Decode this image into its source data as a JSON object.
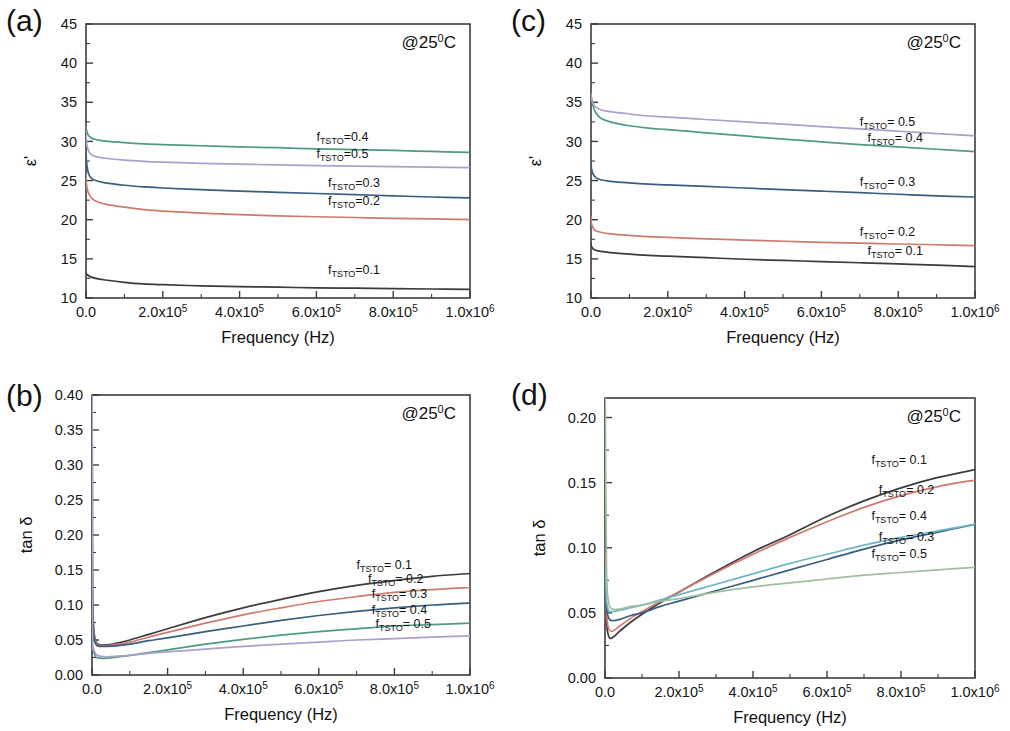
{
  "figure": {
    "panels": [
      "a",
      "b",
      "c",
      "d"
    ],
    "temperature_annotation": {
      "prefix": "@25",
      "sup": "0",
      "suffix": "C"
    },
    "series_colors": {
      "0.1": "#3b3b3b",
      "0.2": "#cf7a6d",
      "0.3": "#3a5d82",
      "0.4": "#4e9b80",
      "0.5": "#a9a0cb"
    }
  },
  "panel_a": {
    "tag": "(a)",
    "xlabel": "Frequency (Hz)",
    "ylabel": "ε'",
    "temp": "@25",
    "temp_sup": "0",
    "temp_suffix": "C",
    "ylim": [
      10,
      45
    ],
    "yticks": [
      10,
      15,
      20,
      25,
      30,
      35,
      40,
      45
    ],
    "xticks": [
      "0.0",
      "2.0x10",
      "4.0x10",
      "6.0x10",
      "8.0x10",
      "1.0x10"
    ],
    "xtick_sups": [
      "",
      "5",
      "5",
      "5",
      "5",
      "6"
    ],
    "labels": [
      {
        "text": "f",
        "sub": "TSTO",
        "rest": "=0.4"
      },
      {
        "text": "f",
        "sub": "TSTO",
        "rest": "=0.5"
      },
      {
        "text": "f",
        "sub": "TSTO",
        "rest": "=0.3"
      },
      {
        "text": "f",
        "sub": "TSTO",
        "rest": "=0.2"
      },
      {
        "text": "f",
        "sub": "TSTO",
        "rest": "=0.1"
      }
    ]
  },
  "panel_b": {
    "tag": "(b)",
    "xlabel": "Frequency (Hz)",
    "ylabel": "tan δ",
    "temp": "@25",
    "temp_sup": "0",
    "temp_suffix": "C",
    "ylim": [
      0.0,
      0.4
    ],
    "yticks": [
      "0.00",
      "0.05",
      "0.10",
      "0.15",
      "0.20",
      "0.25",
      "0.30",
      "0.35",
      "0.40"
    ],
    "xticks": [
      "0.0",
      "2.0x10",
      "4.0x10",
      "6.0x10",
      "8.0x10",
      "1.0x10"
    ],
    "xtick_sups": [
      "",
      "5",
      "5",
      "5",
      "5",
      "6"
    ],
    "labels": [
      {
        "text": "f",
        "sub": "TSTO",
        "rest": "= 0.1"
      },
      {
        "text": "f",
        "sub": "TSTO",
        "rest": "= 0.2"
      },
      {
        "text": "f",
        "sub": "TSTO",
        "rest": "= 0.3"
      },
      {
        "text": "f",
        "sub": "TSTO",
        "rest": "= 0.4"
      },
      {
        "text": "f",
        "sub": "TSTO",
        "rest": "= 0.5"
      }
    ]
  },
  "panel_c": {
    "tag": "(c)",
    "xlabel": "Frequency (Hz)",
    "ylabel": "ε'",
    "temp": "@25",
    "temp_sup": "0",
    "temp_suffix": "C",
    "ylim": [
      10,
      45
    ],
    "yticks": [
      10,
      15,
      20,
      25,
      30,
      35,
      40,
      45
    ],
    "xticks": [
      "0.0",
      "2.0x10",
      "4.0x10",
      "6.0x10",
      "8.0x10",
      "1.0x10"
    ],
    "xtick_sups": [
      "",
      "5",
      "5",
      "5",
      "5",
      "6"
    ],
    "labels": [
      {
        "text": "f",
        "sub": "TSTO",
        "rest": "= 0.5"
      },
      {
        "text": "f",
        "sub": "TSTO",
        "rest": "= 0.4"
      },
      {
        "text": "f",
        "sub": "TSTO",
        "rest": "= 0.3"
      },
      {
        "text": "f",
        "sub": "TSTO",
        "rest": "= 0.2"
      },
      {
        "text": "f",
        "sub": "TSTO",
        "rest": "= 0.1"
      }
    ]
  },
  "panel_d": {
    "tag": "(d)",
    "xlabel": "Frequency (Hz)",
    "ylabel": "tan δ",
    "temp": "@25",
    "temp_sup": "0",
    "temp_suffix": "C",
    "ylim": [
      0.0,
      0.215
    ],
    "yticks": [
      "0.00",
      "0.05",
      "0.10",
      "0.15",
      "0.20"
    ],
    "xticks": [
      "0.0",
      "2.0x10",
      "4.0x10",
      "6.0x10",
      "8.0x10",
      "1.0x10"
    ],
    "xtick_sups": [
      "",
      "5",
      "5",
      "5",
      "5",
      "6"
    ],
    "labels": [
      {
        "text": "f",
        "sub": "TSTO",
        "rest": "= 0.1"
      },
      {
        "text": "f",
        "sub": "TSTO",
        "rest": "= 0.2"
      },
      {
        "text": "f",
        "sub": "TSTO",
        "rest": "= 0.4"
      },
      {
        "text": "f",
        "sub": "TSTO",
        "rest": "= 0.3"
      },
      {
        "text": "f",
        "sub": "TSTO",
        "rest": "= 0.5"
      }
    ]
  },
  "chart_data": [
    {
      "panel": "a",
      "type": "line",
      "title": "(a) Dielectric constant vs frequency at 25 C",
      "xlabel": "Frequency (Hz)",
      "ylabel": "epsilon'",
      "xlim": [
        0,
        1000000
      ],
      "ylim": [
        10,
        45
      ],
      "grid": false,
      "legend": "inline-right",
      "x": [
        1000,
        5000,
        12000,
        25000,
        50000,
        100000,
        150000,
        200000,
        300000,
        400000,
        500000,
        600000,
        700000,
        800000,
        900000,
        1000000
      ],
      "series": [
        {
          "name": "f_TSTO=0.1",
          "color": "#3b3b3b",
          "values": [
            13.1,
            12.9,
            12.7,
            12.5,
            12.3,
            12.0,
            11.8,
            11.7,
            11.55,
            11.45,
            11.38,
            11.3,
            11.25,
            11.2,
            11.15,
            11.1
          ]
        },
        {
          "name": "f_TSTO=0.2",
          "color": "#cf7a6d",
          "values": [
            24.6,
            23.6,
            22.9,
            22.4,
            22.0,
            21.6,
            21.3,
            21.1,
            20.85,
            20.65,
            20.5,
            20.38,
            20.28,
            20.18,
            20.1,
            20.0
          ]
        },
        {
          "name": "f_TSTO=0.3",
          "color": "#3a5d82",
          "values": [
            27.6,
            26.2,
            25.4,
            25.0,
            24.7,
            24.4,
            24.2,
            24.05,
            23.85,
            23.65,
            23.5,
            23.35,
            23.2,
            23.05,
            22.9,
            22.8
          ]
        },
        {
          "name": "f_TSTO=0.4",
          "color": "#4e9b80",
          "values": [
            31.5,
            30.9,
            30.5,
            30.25,
            30.05,
            29.85,
            29.7,
            29.6,
            29.45,
            29.3,
            29.2,
            29.05,
            28.95,
            28.85,
            28.72,
            28.6
          ]
        },
        {
          "name": "f_TSTO=0.5",
          "color": "#a9a0cb",
          "values": [
            30.0,
            29.0,
            28.4,
            28.05,
            27.85,
            27.6,
            27.45,
            27.35,
            27.2,
            27.1,
            27.0,
            26.9,
            26.85,
            26.78,
            26.72,
            26.65
          ]
        }
      ]
    },
    {
      "panel": "b",
      "type": "line",
      "title": "(b) Dielectric loss tangent vs frequency at 25 C",
      "xlabel": "Frequency (Hz)",
      "ylabel": "tan delta",
      "xlim": [
        0,
        1000000
      ],
      "ylim": [
        0.0,
        0.4
      ],
      "grid": false,
      "legend": "inline-right",
      "x": [
        1000,
        4000,
        10000,
        20000,
        40000,
        70000,
        100000,
        150000,
        200000,
        300000,
        400000,
        500000,
        600000,
        700000,
        800000,
        900000,
        1000000
      ],
      "series": [
        {
          "name": "f_TSTO = 0.1",
          "color": "#3b3b3b",
          "values": [
            0.126,
            0.07,
            0.048,
            0.043,
            0.043,
            0.046,
            0.05,
            0.058,
            0.066,
            0.082,
            0.096,
            0.108,
            0.119,
            0.128,
            0.135,
            0.141,
            0.145
          ]
        },
        {
          "name": "f_TSTO = 0.2",
          "color": "#cf7a6d",
          "values": [
            0.122,
            0.066,
            0.046,
            0.042,
            0.042,
            0.044,
            0.047,
            0.054,
            0.061,
            0.074,
            0.086,
            0.096,
            0.105,
            0.112,
            0.118,
            0.122,
            0.125
          ]
        },
        {
          "name": "f_TSTO = 0.3",
          "color": "#3a5d82",
          "values": [
            0.118,
            0.06,
            0.044,
            0.041,
            0.041,
            0.042,
            0.044,
            0.049,
            0.053,
            0.062,
            0.07,
            0.078,
            0.085,
            0.091,
            0.096,
            0.1,
            0.103
          ]
        },
        {
          "name": "f_TSTO = 0.4",
          "color": "#4e9b80",
          "values": [
            0.065,
            0.035,
            0.026,
            0.024,
            0.024,
            0.026,
            0.028,
            0.032,
            0.036,
            0.044,
            0.051,
            0.057,
            0.062,
            0.066,
            0.07,
            0.072,
            0.074
          ]
        },
        {
          "name": "f_TSTO = 0.5",
          "color": "#a9a0cb",
          "values": [
            0.06,
            0.038,
            0.03,
            0.027,
            0.026,
            0.027,
            0.028,
            0.031,
            0.033,
            0.037,
            0.041,
            0.044,
            0.047,
            0.05,
            0.052,
            0.054,
            0.056
          ]
        }
      ],
      "annotations": [
        {
          "text": "off-scale spike near f=0 reaching above 0.40"
        }
      ]
    },
    {
      "panel": "c",
      "type": "line",
      "title": "(c) Dielectric constant vs frequency at 25 C",
      "xlabel": "Frequency (Hz)",
      "ylabel": "epsilon'",
      "xlim": [
        0,
        1000000
      ],
      "ylim": [
        10,
        45
      ],
      "grid": false,
      "legend": "inline-right",
      "x": [
        1000,
        5000,
        12000,
        25000,
        50000,
        100000,
        150000,
        200000,
        300000,
        400000,
        500000,
        600000,
        700000,
        800000,
        900000,
        1000000
      ],
      "series": [
        {
          "name": "f_TSTO= 0.1",
          "color": "#3b3b3b",
          "values": [
            16.6,
            16.3,
            16.1,
            15.95,
            15.8,
            15.6,
            15.45,
            15.35,
            15.15,
            14.95,
            14.8,
            14.65,
            14.5,
            14.35,
            14.2,
            14.0
          ]
        },
        {
          "name": "f_TSTO= 0.2",
          "color": "#cf7a6d",
          "values": [
            19.6,
            19.0,
            18.6,
            18.4,
            18.2,
            18.0,
            17.85,
            17.75,
            17.55,
            17.4,
            17.25,
            17.1,
            17.0,
            16.9,
            16.8,
            16.7
          ]
        },
        {
          "name": "f_TSTO= 0.3",
          "color": "#3a5d82",
          "values": [
            26.6,
            25.9,
            25.4,
            25.1,
            24.9,
            24.7,
            24.55,
            24.45,
            24.25,
            24.05,
            23.85,
            23.65,
            23.45,
            23.25,
            23.05,
            22.9
          ]
        },
        {
          "name": "f_TSTO= 0.4",
          "color": "#4e9b80",
          "values": [
            35.6,
            34.6,
            33.7,
            33.0,
            32.5,
            32.0,
            31.7,
            31.5,
            31.1,
            30.7,
            30.3,
            29.95,
            29.6,
            29.3,
            29.0,
            28.7
          ]
        },
        {
          "name": "f_TSTO= 0.5",
          "color": "#a9a0cb",
          "values": [
            35.5,
            34.9,
            34.4,
            34.05,
            33.8,
            33.5,
            33.25,
            33.1,
            32.8,
            32.5,
            32.2,
            31.9,
            31.6,
            31.3,
            31.0,
            30.7
          ]
        }
      ]
    },
    {
      "panel": "d",
      "type": "line",
      "title": "(d) Dielectric loss tangent vs frequency at 25 C",
      "xlabel": "Frequency (Hz)",
      "ylabel": "tan delta",
      "xlim": [
        0,
        1000000
      ],
      "ylim": [
        0.0,
        0.215
      ],
      "grid": false,
      "legend": "inline-right",
      "x": [
        1000,
        4000,
        10000,
        20000,
        40000,
        70000,
        100000,
        150000,
        200000,
        300000,
        400000,
        500000,
        600000,
        700000,
        800000,
        900000,
        1000000
      ],
      "series": [
        {
          "name": "f_TSTO= 0.1",
          "color": "#3b3b3b",
          "values": [
            0.09,
            0.045,
            0.032,
            0.031,
            0.036,
            0.043,
            0.049,
            0.058,
            0.066,
            0.082,
            0.097,
            0.11,
            0.124,
            0.136,
            0.146,
            0.154,
            0.16
          ]
        },
        {
          "name": "f_TSTO= 0.2",
          "color": "#cf7a6d",
          "values": [
            0.095,
            0.05,
            0.038,
            0.036,
            0.04,
            0.046,
            0.051,
            0.059,
            0.066,
            0.081,
            0.095,
            0.108,
            0.12,
            0.131,
            0.14,
            0.147,
            0.152
          ]
        },
        {
          "name": "f_TSTO= 0.3",
          "color": "#3a5d82",
          "values": [
            0.082,
            0.055,
            0.046,
            0.044,
            0.045,
            0.048,
            0.05,
            0.055,
            0.059,
            0.067,
            0.075,
            0.083,
            0.091,
            0.099,
            0.106,
            0.112,
            0.118
          ]
        },
        {
          "name": "f_TSTO= 0.4",
          "color": "#6fb6c4",
          "values": [
            0.086,
            0.06,
            0.052,
            0.051,
            0.052,
            0.054,
            0.056,
            0.06,
            0.064,
            0.072,
            0.08,
            0.088,
            0.095,
            0.102,
            0.108,
            0.113,
            0.118
          ]
        },
        {
          "name": "f_TSTO= 0.5",
          "color": "#9fbf9f",
          "values": [
            0.207,
            0.085,
            0.058,
            0.053,
            0.053,
            0.055,
            0.056,
            0.059,
            0.061,
            0.066,
            0.07,
            0.073,
            0.076,
            0.079,
            0.081,
            0.083,
            0.085
          ]
        }
      ],
      "annotations": [
        {
          "text": "off-scale spike near f=0 reaching about 0.21"
        }
      ]
    }
  ]
}
